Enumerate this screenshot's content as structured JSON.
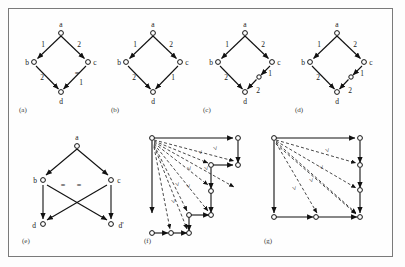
{
  "figure": {
    "caption_labels": [
      "(a)",
      "(b)",
      "(c)",
      "(d)",
      "(e)",
      "(f)",
      "(g)"
    ],
    "colors": {
      "frame": "#7a7a7a",
      "background": "#fefefe",
      "edge": "#111111",
      "node_fill": "#ffffff",
      "text": "#1a1a1a"
    }
  },
  "panels": {
    "a": {
      "label": "(a)",
      "nodes": [
        {
          "id": "a",
          "label": "a"
        },
        {
          "id": "b",
          "label": "b"
        },
        {
          "id": "c",
          "label": "c"
        },
        {
          "id": "d",
          "label": "d"
        }
      ],
      "edges": [
        {
          "from": "a",
          "to": "b",
          "label": "1",
          "style": "solid"
        },
        {
          "from": "a",
          "to": "c",
          "label": "2",
          "style": "solid"
        },
        {
          "from": "b",
          "to": "d",
          "label": "2",
          "style": "solid"
        },
        {
          "from": "c",
          "to": "d",
          "label": "1",
          "style": "solid"
        }
      ],
      "tick_marks": [
        {
          "on_edge": "c-d",
          "symbol": "="
        }
      ]
    },
    "b": {
      "label": "(b)",
      "nodes": [
        {
          "id": "a",
          "label": "a"
        },
        {
          "id": "b",
          "label": "b"
        },
        {
          "id": "c",
          "label": "c"
        },
        {
          "id": "d",
          "label": "d"
        }
      ],
      "edges": [
        {
          "from": "a",
          "to": "b",
          "label": "1",
          "style": "solid"
        },
        {
          "from": "a",
          "to": "c",
          "label": "2",
          "style": "solid"
        },
        {
          "from": "b",
          "to": "d",
          "label": "2",
          "style": "solid"
        },
        {
          "from": "c",
          "to": "d",
          "label": "1",
          "style": "solid"
        }
      ],
      "tick_marks": []
    },
    "c": {
      "label": "(c)",
      "nodes": [
        {
          "id": "a",
          "label": "a"
        },
        {
          "id": "b",
          "label": "b"
        },
        {
          "id": "c",
          "label": "c"
        },
        {
          "id": "d",
          "label": "d"
        },
        {
          "id": "m",
          "label": ""
        }
      ],
      "edges": [
        {
          "from": "a",
          "to": "b",
          "label": "1",
          "style": "solid"
        },
        {
          "from": "a",
          "to": "c",
          "label": "2",
          "style": "solid"
        },
        {
          "from": "b",
          "to": "d",
          "label": "2",
          "style": "solid"
        },
        {
          "from": "c",
          "to": "m",
          "label": "1",
          "style": "solid"
        },
        {
          "from": "m",
          "to": "d",
          "label": "2",
          "style": "solid"
        }
      ],
      "tick_marks": []
    },
    "d": {
      "label": "(d)",
      "nodes": [
        {
          "id": "a",
          "label": "a"
        },
        {
          "id": "b",
          "label": "b"
        },
        {
          "id": "c",
          "label": "c"
        },
        {
          "id": "d",
          "label": "d"
        },
        {
          "id": "m",
          "label": ""
        }
      ],
      "edges": [
        {
          "from": "a",
          "to": "b",
          "label": "1",
          "style": "solid"
        },
        {
          "from": "a",
          "to": "c",
          "label": "2",
          "style": "solid"
        },
        {
          "from": "b",
          "to": "d",
          "label": "2",
          "style": "solid"
        },
        {
          "from": "c",
          "to": "m",
          "label": "1",
          "style": "solid"
        },
        {
          "from": "m",
          "to": "d",
          "label": "2",
          "style": "solid"
        }
      ],
      "tick_marks": []
    },
    "e": {
      "label": "(e)",
      "nodes": [
        {
          "id": "a",
          "label": "a"
        },
        {
          "id": "b",
          "label": "b"
        },
        {
          "id": "c",
          "label": "c"
        },
        {
          "id": "d",
          "label": "d"
        },
        {
          "id": "dp",
          "label": "d'"
        }
      ],
      "edges": [
        {
          "from": "a",
          "to": "b",
          "label": "",
          "style": "solid"
        },
        {
          "from": "a",
          "to": "c",
          "label": "",
          "style": "solid"
        },
        {
          "from": "b",
          "to": "d",
          "label": "",
          "style": "solid"
        },
        {
          "from": "b",
          "to": "dp",
          "label": "",
          "style": "solid"
        },
        {
          "from": "c",
          "to": "d",
          "label": "",
          "style": "solid"
        },
        {
          "from": "c",
          "to": "dp",
          "label": "",
          "style": "solid"
        }
      ],
      "tick_marks": [
        {
          "on_edge": "b-dp",
          "symbol": "="
        },
        {
          "on_edge": "c-d",
          "symbol": "="
        }
      ]
    },
    "f": {
      "label": "(f)",
      "dashed_edge_marker": ">",
      "dashed_edge_count": 8,
      "solid_path_description": "staircase grid path",
      "nodes_count": 12
    },
    "g": {
      "label": "(g)",
      "dashed_edge_marker": ">",
      "dashed_edge_count": 5,
      "solid_path_description": "square boundary path",
      "nodes_count": 8
    }
  }
}
